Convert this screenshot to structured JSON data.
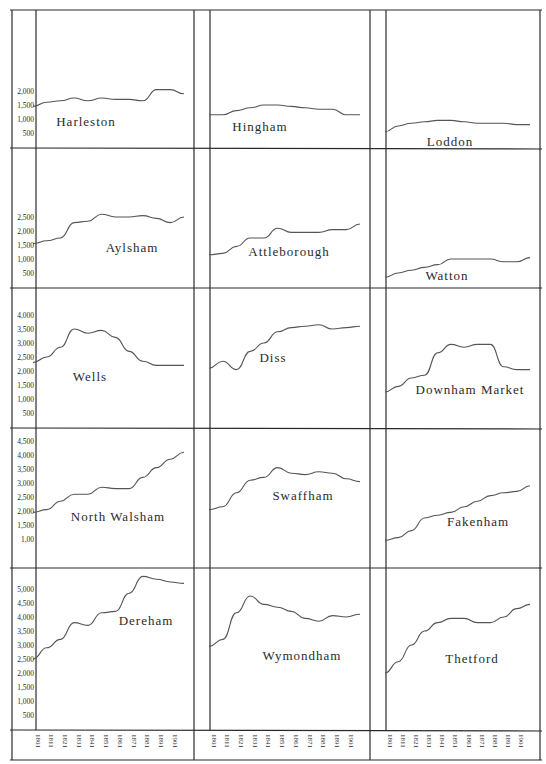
{
  "chart_data": {
    "type": "line",
    "title": "",
    "xlabel": "",
    "ylabel": "",
    "layout": {
      "grid_rows": 5,
      "grid_cols": 3,
      "legend": "none",
      "grid": false
    },
    "x": [
      1801,
      1811,
      1821,
      1831,
      1841,
      1851,
      1861,
      1871,
      1881,
      1891,
      1901,
      1911
    ],
    "x_tick_labels": [
      "1801",
      "1811",
      "1821",
      "1831",
      "1841",
      "1851",
      "1861",
      "1871",
      "1881",
      "1891",
      "1901"
    ],
    "panels": [
      {
        "name": "Harleston",
        "row": 0,
        "col": 0,
        "y_ticks": [
          "2,000",
          "1,500",
          "1,000",
          "500"
        ],
        "ylim": [
          0,
          2000
        ],
        "values": [
          1450,
          1600,
          1650,
          1750,
          1650,
          1750,
          1700,
          1700,
          1650,
          2050,
          2050,
          1900
        ]
      },
      {
        "name": "Hingham",
        "row": 0,
        "col": 1,
        "y_ticks": [],
        "ylim": [
          0,
          2000
        ],
        "values": [
          1150,
          1150,
          1300,
          1400,
          1500,
          1500,
          1450,
          1400,
          1350,
          1350,
          1150,
          1150
        ]
      },
      {
        "name": "Loddon",
        "row": 0,
        "col": 2,
        "y_ticks": [],
        "ylim": [
          0,
          2000
        ],
        "values": [
          550,
          750,
          850,
          900,
          950,
          950,
          900,
          850,
          850,
          850,
          800,
          800
        ]
      },
      {
        "name": "Aylsham",
        "row": 1,
        "col": 0,
        "y_ticks": [
          "2,500",
          "2,000",
          "1,500",
          "1,000",
          "500"
        ],
        "ylim": [
          0,
          2500
        ],
        "values": [
          1550,
          1650,
          1750,
          2300,
          2350,
          2600,
          2500,
          2500,
          2550,
          2450,
          2300,
          2500
        ]
      },
      {
        "name": "Attleborough",
        "row": 1,
        "col": 1,
        "y_ticks": [],
        "ylim": [
          0,
          2500
        ],
        "values": [
          1150,
          1200,
          1450,
          1750,
          1750,
          2100,
          1950,
          1950,
          1950,
          2050,
          2050,
          2250
        ]
      },
      {
        "name": "Watton",
        "row": 1,
        "col": 2,
        "y_ticks": [],
        "ylim": [
          0,
          2500
        ],
        "values": [
          350,
          500,
          600,
          700,
          800,
          1000,
          1000,
          1000,
          1000,
          900,
          900,
          1050
        ]
      },
      {
        "name": "Wells",
        "row": 2,
        "col": 0,
        "y_ticks": [
          "4,000",
          "3,500",
          "3,000",
          "2,500",
          "2,000",
          "1,500",
          "1,000",
          "500"
        ],
        "ylim": [
          0,
          4000
        ],
        "values": [
          2300,
          2500,
          2850,
          3500,
          3350,
          3450,
          3200,
          2700,
          2350,
          2200,
          2200,
          2200
        ]
      },
      {
        "name": "Diss",
        "row": 2,
        "col": 1,
        "y_ticks": [],
        "ylim": [
          0,
          4000
        ],
        "values": [
          2100,
          2350,
          2050,
          2700,
          3000,
          3400,
          3550,
          3600,
          3650,
          3500,
          3550,
          3600
        ]
      },
      {
        "name": "Downham Market",
        "row": 2,
        "col": 2,
        "y_ticks": [],
        "ylim": [
          0,
          4000
        ],
        "values": [
          1250,
          1450,
          1750,
          1850,
          2650,
          2950,
          2850,
          2950,
          2950,
          2150,
          2050,
          2050
        ]
      },
      {
        "name": "North Walsham",
        "row": 3,
        "col": 0,
        "y_ticks": [
          "4,500",
          "4,000",
          "3,500",
          "3,000",
          "2,500",
          "2,000",
          "1,500",
          "1,00"
        ],
        "ylim": [
          0,
          4500
        ],
        "values": [
          1950,
          2050,
          2350,
          2600,
          2600,
          2850,
          2800,
          2800,
          3200,
          3550,
          3850,
          4100
        ]
      },
      {
        "name": "Swaffham",
        "row": 3,
        "col": 1,
        "y_ticks": [],
        "ylim": [
          0,
          4500
        ],
        "values": [
          2050,
          2150,
          2650,
          3100,
          3200,
          3550,
          3350,
          3300,
          3400,
          3350,
          3150,
          3050
        ]
      },
      {
        "name": "Fakenham",
        "row": 3,
        "col": 2,
        "y_ticks": [],
        "ylim": [
          0,
          4500
        ],
        "values": [
          950,
          1050,
          1300,
          1750,
          1850,
          1950,
          2150,
          2350,
          2550,
          2650,
          2700,
          2900
        ]
      },
      {
        "name": "Dereham",
        "row": 4,
        "col": 0,
        "y_ticks": [
          "5,000",
          "4,500",
          "4,000",
          "3,500",
          "3,000",
          "2,500",
          "2,000",
          "1,500",
          "1,000",
          "500"
        ],
        "ylim": [
          0,
          5000
        ],
        "values": [
          2500,
          2900,
          3200,
          3800,
          3700,
          4150,
          4200,
          4850,
          5450,
          5350,
          5250,
          5200
        ]
      },
      {
        "name": "Wymondham",
        "row": 4,
        "col": 1,
        "y_ticks": [],
        "ylim": [
          0,
          5000
        ],
        "values": [
          2950,
          3200,
          4150,
          4750,
          4450,
          4350,
          4200,
          3950,
          3850,
          4050,
          4000,
          4100
        ]
      },
      {
        "name": "Thetford",
        "row": 4,
        "col": 2,
        "y_ticks": [],
        "ylim": [
          0,
          5000
        ],
        "values": [
          2000,
          2400,
          3000,
          3500,
          3800,
          3950,
          3950,
          3800,
          3800,
          4000,
          4300,
          4450
        ]
      }
    ]
  },
  "panels": [
    {
      "label": "Harleston"
    },
    {
      "label": "Hingham"
    },
    {
      "label": "Loddon"
    },
    {
      "label": "Aylsham"
    },
    {
      "label": "Attleborough"
    },
    {
      "label": "Watton"
    },
    {
      "label": "Wells"
    },
    {
      "label": "Diss"
    },
    {
      "label": "Downham Market"
    },
    {
      "label": "North Walsham"
    },
    {
      "label": "Swaffham"
    },
    {
      "label": "Fakenham"
    },
    {
      "label": "Dereham"
    },
    {
      "label": "Wymondham"
    },
    {
      "label": "Thetford"
    }
  ],
  "colors": {
    "ink": "#2a2a2a",
    "paper": "#ffffff",
    "line": "#555555"
  }
}
